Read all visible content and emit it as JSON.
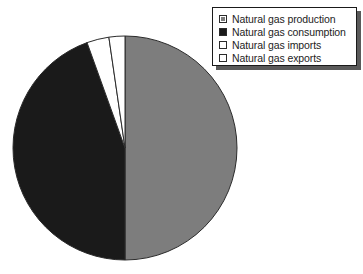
{
  "chart_data": {
    "type": "pie",
    "title": "",
    "categories": [
      "Natural gas production",
      "Natural gas consumption",
      "Natural gas imports",
      "Natural gas exports"
    ],
    "values": [
      50.0,
      44.5,
      3.2,
      2.3
    ],
    "units": "percent of total",
    "start_angle_deg": 0,
    "direction": "clockwise",
    "colors": [
      "#7d7d7d",
      "#1a1a1a",
      "#ffffff",
      "#ffffff"
    ],
    "slice_edge_color": "#2b2b2b",
    "legend_position": "top-right",
    "grid": false,
    "xlabel": "",
    "ylabel": "",
    "slices": [
      {
        "label": "Natural gas production",
        "value": 50.0,
        "color": "#7d7d7d",
        "swatch": "gray-filled"
      },
      {
        "label": "Natural gas consumption",
        "value": 44.5,
        "color": "#1a1a1a",
        "swatch": "black-filled"
      },
      {
        "label": "Natural gas imports",
        "value": 3.2,
        "color": "#ffffff",
        "swatch": "white-empty"
      },
      {
        "label": "Natural gas exports",
        "value": 2.3,
        "color": "#ffffff",
        "swatch": "white-empty"
      }
    ]
  },
  "legend": {
    "items": [
      {
        "label": "Natural gas production"
      },
      {
        "label": "Natural gas consumption"
      },
      {
        "label": "Natural gas imports"
      },
      {
        "label": "Natural gas exports"
      }
    ]
  },
  "geometry": {
    "center_x": 125,
    "center_y": 148,
    "radius": 112
  }
}
